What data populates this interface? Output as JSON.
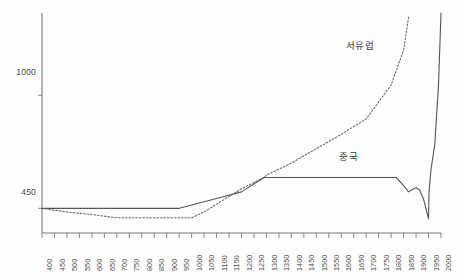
{
  "chart_data": {
    "type": "line",
    "title": "",
    "subtitle": "",
    "xlabel": "",
    "ylabel": "",
    "xlim": [
      400,
      2000
    ],
    "ylim": [
      330,
      1400
    ],
    "grid": false,
    "legend_position": "inline-annotations",
    "x_tick_labels": [
      "400",
      "450",
      "500",
      "550",
      "600",
      "650",
      "700",
      "750",
      "800",
      "850",
      "900",
      "950",
      "1000",
      "1050",
      "1100",
      "1150",
      "1200",
      "1250",
      "1300",
      "1350",
      "1400",
      "1450",
      "1500",
      "1550",
      "1600",
      "1650",
      "1700",
      "1750",
      "1800",
      "1850",
      "1900",
      "1950",
      "2000"
    ],
    "y_tick_labels": [
      "450",
      "1000"
    ],
    "y_tick_values": [
      450,
      1000
    ],
    "annotations": [
      {
        "name": "series-label-western-europe",
        "text": "서유럽",
        "x": 1740,
        "y": 1245
      },
      {
        "name": "series-label-china",
        "text": "중국",
        "x": 1640,
        "y": 700
      }
    ],
    "series": [
      {
        "name": "중국",
        "style": "solid",
        "color": "#555555",
        "x": [
          400,
          500,
          600,
          700,
          800,
          900,
          950,
          1000,
          1100,
          1200,
          1290,
          1300,
          1400,
          1500,
          1600,
          1700,
          1800,
          1820,
          1850,
          1870,
          1890,
          1900,
          1913,
          1930,
          1950,
          1952,
          1960,
          1975,
          1990,
          2000
        ],
        "values": [
          450,
          450,
          450,
          450,
          450,
          450,
          450,
          466,
          498,
          530,
          600,
          600,
          600,
          600,
          600,
          600,
          600,
          600,
          560,
          530,
          545,
          550,
          540,
          495,
          400,
          530,
          640,
          760,
          1050,
          1400
        ]
      },
      {
        "name": "서유럽",
        "style": "dotted",
        "color": "#6a6a6a",
        "x": [
          400,
          500,
          600,
          700,
          800,
          900,
          1000,
          1050,
          1100,
          1200,
          1290,
          1300,
          1400,
          1500,
          1600,
          1700,
          1800,
          1850,
          1870
        ],
        "values": [
          450,
          432,
          420,
          404,
          404,
          404,
          404,
          432,
          470,
          545,
          600,
          612,
          670,
          740,
          810,
          885,
          1050,
          1220,
          1380
        ]
      }
    ]
  }
}
